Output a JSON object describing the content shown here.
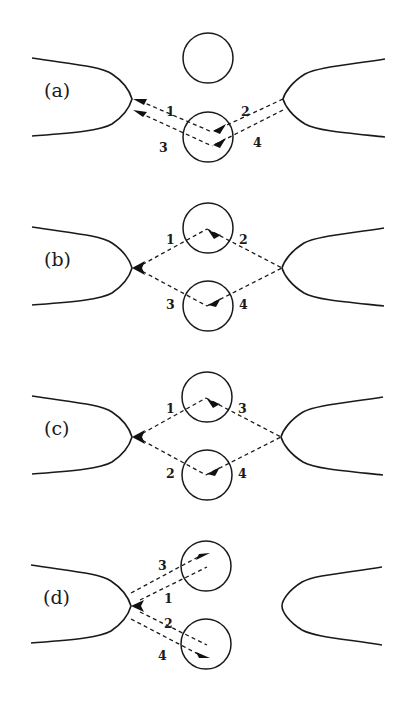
{
  "diagram": {
    "type": "scattering-path-schematic",
    "panels": [
      {
        "id": "a",
        "label": "(a)",
        "description": "Left and right point contacts with two scatterers (circles); paths leave/return to the left contact, bottom scatterer is crossed by paths 1-4",
        "path_labels": {
          "p1": "1",
          "p2": "2",
          "p3": "3",
          "p4": "4"
        }
      },
      {
        "id": "b",
        "label": "(b)",
        "description": "Diamond of paths between left and right contacts via upper and lower scatterers",
        "path_labels": {
          "p1": "1",
          "p2": "2",
          "p3": "3",
          "p4": "4"
        }
      },
      {
        "id": "c",
        "label": "(c)",
        "description": "Same diamond geometry as (b) with path numbering changed",
        "path_labels": {
          "p1": "1",
          "p2": "2",
          "p3": "3",
          "p4": "4"
        }
      },
      {
        "id": "d",
        "label": "(d)",
        "description": "Paths from left contact reflected back by two scatterers; right contact not reached",
        "path_labels": {
          "p1": "1",
          "p2": "2",
          "p3": "3",
          "p4": "4"
        }
      }
    ],
    "colors": {
      "stroke": "#1a1a1a",
      "background": "#ffffff"
    }
  }
}
